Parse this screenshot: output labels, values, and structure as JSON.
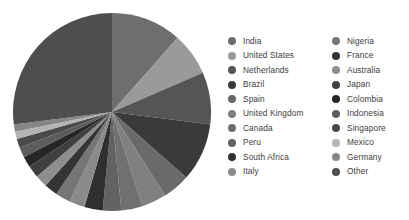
{
  "chart_data": {
    "type": "pie",
    "title": "",
    "subtitle": "",
    "xlabel": "",
    "ylabel": "",
    "grid": false,
    "legend_position": "right",
    "legend_columns": 2,
    "start_angle_deg": -90,
    "direction": "clockwise",
    "labels": [
      "India",
      "United States",
      "Netherlands",
      "Brazil",
      "Spain",
      "United Kingdom",
      "Canada",
      "Peru",
      "South Africa",
      "Italy",
      "Nigeria",
      "France",
      "Australia",
      "Japan",
      "Colombia",
      "Indonesia",
      "Singapore",
      "Mexico",
      "Germany",
      "Other"
    ],
    "values": [
      11.5,
      7.0,
      8.5,
      9.5,
      4.5,
      4.0,
      3.5,
      3.0,
      3.0,
      2.5,
      2.5,
      2.2,
      2.0,
      2.0,
      1.8,
      1.6,
      1.5,
      1.2,
      1.2,
      27.0
    ],
    "colors": [
      "#6e6e6e",
      "#9a9a9a",
      "#555555",
      "#3a3a3a",
      "#6a6a6a",
      "#808080",
      "#707070",
      "#626262",
      "#2f2f2f",
      "#8a8a8a",
      "#767676",
      "#353535",
      "#8e8e8e",
      "#404040",
      "#262626",
      "#5c5c5c",
      "#4a4a4a",
      "#b4b4b4",
      "#868686",
      "#4e4e4e"
    ]
  },
  "legend": {
    "columns": [
      {
        "items": [
          {
            "label": "India",
            "color": "#6e6e6e"
          },
          {
            "label": "United States",
            "color": "#9a9a9a"
          },
          {
            "label": "Netherlands",
            "color": "#555555"
          },
          {
            "label": "Brazil",
            "color": "#3a3a3a"
          },
          {
            "label": "Spain",
            "color": "#6a6a6a"
          },
          {
            "label": "United Kingdom",
            "color": "#808080"
          },
          {
            "label": "Canada",
            "color": "#707070"
          },
          {
            "label": "Peru",
            "color": "#626262"
          },
          {
            "label": "South Africa",
            "color": "#2f2f2f"
          },
          {
            "label": "Italy",
            "color": "#8a8a8a"
          }
        ]
      },
      {
        "items": [
          {
            "label": "Nigeria",
            "color": "#767676"
          },
          {
            "label": "France",
            "color": "#353535"
          },
          {
            "label": "Australia",
            "color": "#8e8e8e"
          },
          {
            "label": "Japan",
            "color": "#404040"
          },
          {
            "label": "Colombia",
            "color": "#262626"
          },
          {
            "label": "Indonesia",
            "color": "#5c5c5c"
          },
          {
            "label": "Singapore",
            "color": "#4a4a4a"
          },
          {
            "label": "Mexico",
            "color": "#b4b4b4"
          },
          {
            "label": "Germany",
            "color": "#868686"
          },
          {
            "label": "Other",
            "color": "#4e4e4e"
          }
        ]
      }
    ]
  },
  "canvas": {
    "background": "#ffffff"
  }
}
